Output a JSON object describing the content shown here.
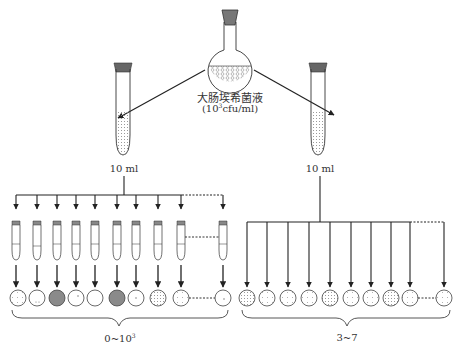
{
  "diagram": {
    "title_label": "大肠埃希菌液",
    "concentration_prefix": "(10",
    "concentration_exp": "3",
    "concentration_suffix": "cfu/ml)",
    "left_tube_volume": "10 ml",
    "right_tube_volume": "10 ml",
    "left_range_prefix": "0~10",
    "left_range_exp": "3",
    "right_range": "3~7",
    "colors": {
      "stroke": "#333333",
      "stopper": "#666666",
      "stopper_light": "#888888",
      "dark_dish": "#888888",
      "dots": "#999999"
    },
    "left_group": {
      "tube_count": 10,
      "dish_states": [
        "sparse-dots",
        "few-dots",
        "dark-filled",
        "single-dot",
        "empty",
        "dark-filled",
        "single-dot",
        "dense-dots",
        "medium-dots",
        "single-dot"
      ]
    },
    "right_group": {
      "branch_count": 10,
      "dish_states": [
        "dots",
        "dots",
        "dots",
        "dots",
        "dots",
        "dots",
        "dots",
        "dots",
        "dots",
        "dots"
      ]
    }
  }
}
